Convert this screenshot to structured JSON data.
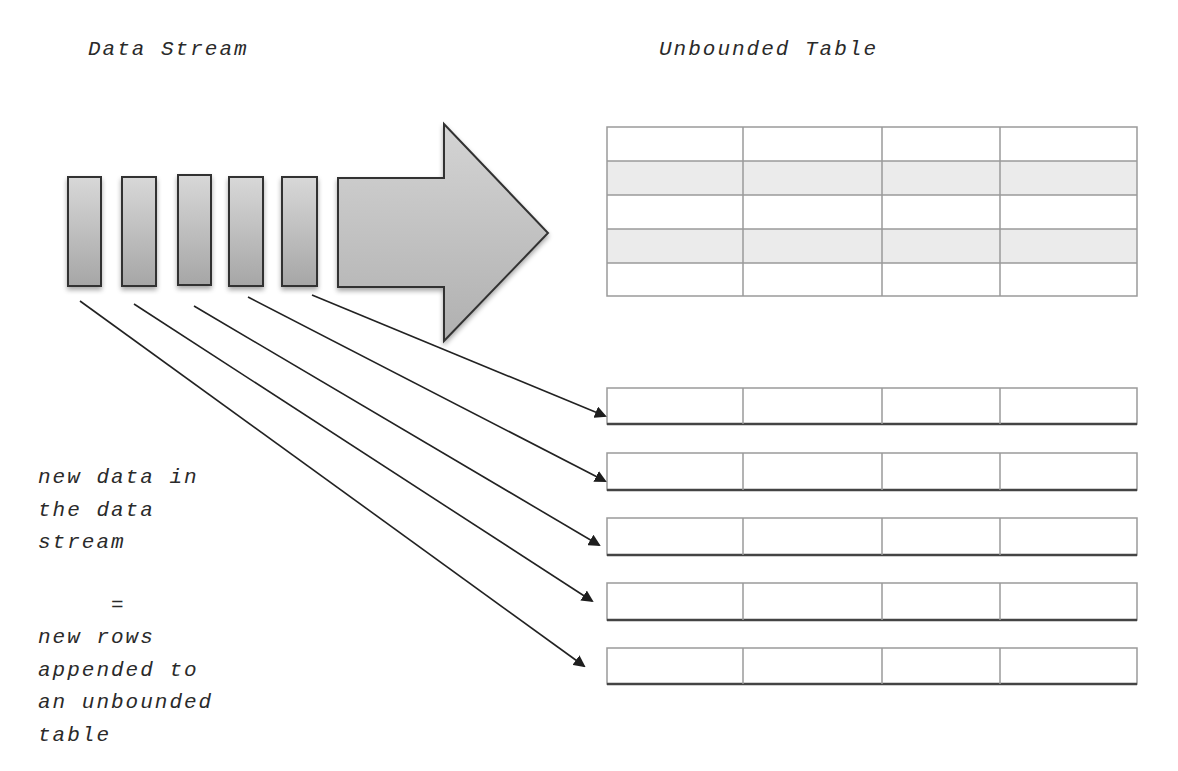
{
  "titles": {
    "left": "Data Stream",
    "right": "Unbounded Table"
  },
  "caption": {
    "lines": [
      "new data in",
      "the data",
      "stream",
      "",
      "     =",
      "new rows",
      "appended to",
      "an unbounded",
      "table"
    ]
  },
  "stream": {
    "blocks": 5,
    "big_arrow": "right-arrow"
  },
  "unbounded_table": {
    "columns": 4,
    "rows": 5,
    "shaded_rows": [
      2,
      4
    ]
  },
  "appended_rows": {
    "count": 5,
    "columns": 4
  },
  "colors": {
    "block_fill_top": "#d6d6d6",
    "block_fill_bottom": "#a9a9a9",
    "outline": "#333333",
    "grid_line": "#9a9a9a",
    "shaded_row": "#ebebeb",
    "connector": "#222222"
  }
}
